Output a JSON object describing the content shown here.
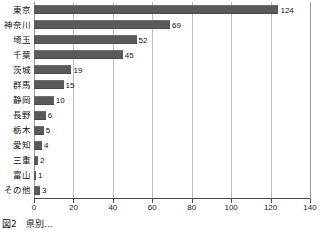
{
  "figure": {
    "caption": "図2　県別…"
  },
  "chart_data": {
    "type": "bar",
    "orientation": "horizontal",
    "title": "",
    "xlabel": "",
    "ylabel": "",
    "xlim": [
      0,
      140
    ],
    "xticks": [
      0,
      20,
      40,
      60,
      80,
      100,
      120,
      140
    ],
    "grid": "vertical",
    "legend": "none",
    "bar_color": "#5a5a5a",
    "gridline_color": "#bdbdbd",
    "axis_color": "#4a4a4a",
    "categories": [
      "東京",
      "神奈川",
      "埼玉",
      "千葉",
      "茨城",
      "群馬",
      "静岡",
      "長野",
      "栃木",
      "愛知",
      "三重",
      "富山",
      "その他"
    ],
    "values": [
      124,
      69,
      52,
      45,
      19,
      15,
      10,
      6,
      5,
      4,
      2,
      1,
      3
    ],
    "data_labels": [
      "124",
      "69",
      "52",
      "45",
      "19",
      "15",
      "10",
      "6",
      "5",
      "4",
      "2",
      "1",
      "3"
    ]
  }
}
